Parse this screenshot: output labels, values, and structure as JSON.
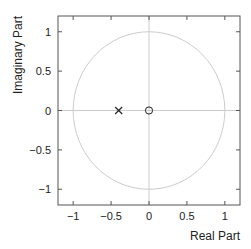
{
  "chart_data": {
    "type": "scatter",
    "title": "",
    "xlabel": "Real Part",
    "ylabel": "Imaginary Part",
    "xlim": [
      -1.2,
      1.2
    ],
    "ylim": [
      -1.2,
      1.2
    ],
    "xticks": [
      -1,
      -0.5,
      0,
      0.5,
      1
    ],
    "yticks": [
      -1,
      -0.5,
      0,
      0.5,
      1
    ],
    "xtick_labels": [
      "−1",
      "−0.5",
      "0",
      "0.5",
      "1"
    ],
    "ytick_labels": [
      "−1",
      "−0.5",
      "0",
      "0.5",
      "1"
    ],
    "grid": false,
    "unit_circle": true,
    "series": [
      {
        "name": "poles",
        "marker": "x",
        "points": [
          {
            "x": -0.4,
            "y": 0
          }
        ]
      },
      {
        "name": "zeros",
        "marker": "o",
        "points": [
          {
            "x": 0,
            "y": 0
          }
        ]
      }
    ]
  },
  "colors": {
    "axes": "#555555",
    "unit_circle": "#cccccc",
    "reference_lines": "#cccccc",
    "markers": "#222222"
  }
}
